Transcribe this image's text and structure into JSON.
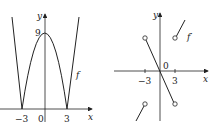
{
  "left_graph": {
    "function_label": "f",
    "y_axis_label": "y",
    "x_axis_label": "x",
    "tick_labels": {
      "neg3": "−3",
      "zero": "0",
      "pos3": "3",
      "peak": "9"
    }
  },
  "right_graph": {
    "function_label": "f′",
    "y_axis_label": "y",
    "x_axis_label": "x",
    "tick_labels": {
      "neg3": "−3",
      "zero": "0",
      "pos3": "3"
    }
  },
  "colors": {
    "stroke": "#222222",
    "background": "#ffffff"
  }
}
